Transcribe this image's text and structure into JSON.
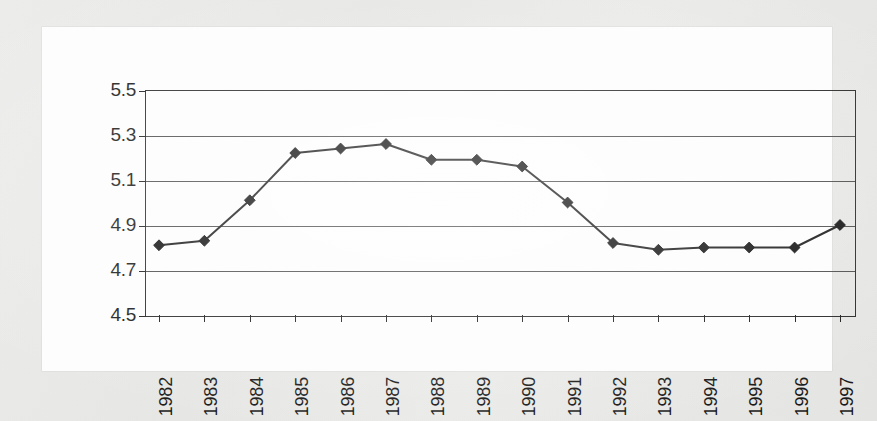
{
  "chart_data": {
    "type": "line",
    "title": "",
    "subtitle": "",
    "xlabel": "",
    "ylabel": "",
    "categories": [
      "1982",
      "1983",
      "1984",
      "1985",
      "1986",
      "1987",
      "1988",
      "1989",
      "1990",
      "1991",
      "1992",
      "1993",
      "1994",
      "1995",
      "1996",
      "1997"
    ],
    "values": [
      4.81,
      4.83,
      5.01,
      5.22,
      5.24,
      5.26,
      5.19,
      5.19,
      5.16,
      5.0,
      4.82,
      4.79,
      4.8,
      4.8,
      4.8,
      4.9
    ],
    "series": [
      {
        "name": "",
        "values": [
          4.81,
          4.83,
          5.01,
          5.22,
          5.24,
          5.26,
          5.19,
          5.19,
          5.16,
          5.0,
          4.82,
          4.79,
          4.8,
          4.8,
          4.8,
          4.9
        ]
      }
    ],
    "ylim": [
      4.5,
      5.5
    ],
    "ytick_labels": [
      "4.5",
      "4.7",
      "4.9",
      "5.1",
      "5.3",
      "5.5"
    ],
    "ytick_values": [
      4.5,
      4.7,
      4.9,
      5.1,
      5.3,
      5.5
    ],
    "xtick_labels": [
      "1982",
      "1983",
      "1984",
      "1985",
      "1986",
      "1987",
      "1988",
      "1989",
      "1990",
      "1991",
      "1992",
      "1993",
      "1994",
      "1995",
      "1996",
      "1997"
    ],
    "grid": "horizontal",
    "legend": "none",
    "marker": "diamond",
    "line_color": "#1a1a1a",
    "marker_color": "#111111",
    "plot_background": "#ffffff",
    "annotations": []
  },
  "page": {
    "background_color": "#e9e9e7",
    "card_color": "#fdfdfd"
  }
}
